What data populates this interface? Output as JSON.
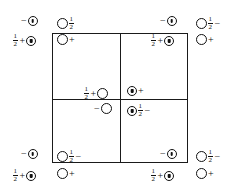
{
  "figure": {
    "name": "crystal-structure-unit-cell-projection",
    "background_color": "#ffffff",
    "line_color": "#1a1a1a",
    "text_color": "#111111"
  },
  "cell": {
    "outline": {
      "left": 52,
      "top": 33,
      "width": 136,
      "height": 130
    },
    "divider_vertical_x": 120,
    "divider_horizontal_y": 99
  },
  "glyphs": {
    "open_circle": "open",
    "marked_circle": "marked",
    "plus": "+",
    "minus": "−",
    "half_numerator": "1",
    "half_denominator": "2"
  },
  "sites": [
    {
      "id": "tl-outer-upper",
      "region": "top-left-outside",
      "parts": [
        "minus",
        "marked-circle"
      ],
      "label": "−ⓧ",
      "x": 20,
      "y": 16
    },
    {
      "id": "tl-outer-lower",
      "region": "top-left-outside",
      "parts": [
        "half",
        "plus",
        "marked-circle"
      ],
      "label": "½+ⓧ",
      "x": 12,
      "y": 33
    },
    {
      "id": "tl-inner-upper",
      "region": "top-left-inside",
      "parts": [
        "open-circle",
        "half"
      ],
      "label": "○½",
      "x": 57,
      "y": 16
    },
    {
      "id": "tl-inner-lower",
      "region": "top-left-inside",
      "parts": [
        "open-circle",
        "plus"
      ],
      "label": "○+",
      "x": 57,
      "y": 34
    },
    {
      "id": "tr-inner-upper",
      "region": "top-right-inside",
      "parts": [
        "minus",
        "marked-circle"
      ],
      "label": "−ⓧ",
      "x": 159,
      "y": 16
    },
    {
      "id": "tr-inner-lower",
      "region": "top-right-inside",
      "parts": [
        "half",
        "plus",
        "marked-circle"
      ],
      "label": "½+ⓧ",
      "x": 150,
      "y": 33
    },
    {
      "id": "tr-outer-upper",
      "region": "top-right-outside",
      "parts": [
        "open-circle",
        "half",
        "minus"
      ],
      "label": "○½−",
      "x": 196,
      "y": 16
    },
    {
      "id": "tr-outer-lower",
      "region": "top-right-outside",
      "parts": [
        "open-circle",
        "plus"
      ],
      "label": "○+",
      "x": 196,
      "y": 34
    },
    {
      "id": "centre-left-upper",
      "region": "cell-centre",
      "parts": [
        "half",
        "plus",
        "open-circle"
      ],
      "label": "½+○",
      "x": 83,
      "y": 86
    },
    {
      "id": "centre-left-lower",
      "region": "cell-centre",
      "parts": [
        "minus",
        "open-circle"
      ],
      "label": "−○",
      "x": 93,
      "y": 103
    },
    {
      "id": "centre-right-upper",
      "region": "cell-centre",
      "parts": [
        "marked-circle",
        "plus"
      ],
      "label": "ⓧ+",
      "x": 127,
      "y": 86
    },
    {
      "id": "centre-right-lower",
      "region": "cell-centre",
      "parts": [
        "marked-circle",
        "half",
        "minus"
      ],
      "label": "ⓧ½−",
      "x": 127,
      "y": 103
    },
    {
      "id": "bl-outer-upper",
      "region": "bottom-left-outside",
      "parts": [
        "minus",
        "marked-circle"
      ],
      "label": "−ⓧ",
      "x": 20,
      "y": 149
    },
    {
      "id": "bl-outer-lower",
      "region": "bottom-left-outside",
      "parts": [
        "half",
        "plus",
        "marked-circle"
      ],
      "label": "½+ⓧ",
      "x": 12,
      "y": 168
    },
    {
      "id": "bl-inner-upper",
      "region": "bottom-left-inside",
      "parts": [
        "open-circle",
        "half",
        "minus"
      ],
      "label": "○½−",
      "x": 57,
      "y": 149
    },
    {
      "id": "bl-inner-lower",
      "region": "bottom-left-inside",
      "parts": [
        "open-circle",
        "plus"
      ],
      "label": "○+",
      "x": 57,
      "y": 168
    },
    {
      "id": "br-inner-upper",
      "region": "bottom-right-inside",
      "parts": [
        "minus",
        "marked-circle"
      ],
      "label": "−ⓧ",
      "x": 159,
      "y": 149
    },
    {
      "id": "br-inner-lower",
      "region": "bottom-right-inside",
      "parts": [
        "half",
        "plus",
        "marked-circle"
      ],
      "label": "½+ⓧ",
      "x": 150,
      "y": 168
    },
    {
      "id": "br-outer-upper",
      "region": "bottom-right-outside",
      "parts": [
        "open-circle",
        "half",
        "minus"
      ],
      "label": "○½−",
      "x": 196,
      "y": 149
    },
    {
      "id": "br-outer-lower",
      "region": "bottom-right-outside",
      "parts": [
        "open-circle",
        "plus"
      ],
      "label": "○+",
      "x": 196,
      "y": 168
    }
  ]
}
